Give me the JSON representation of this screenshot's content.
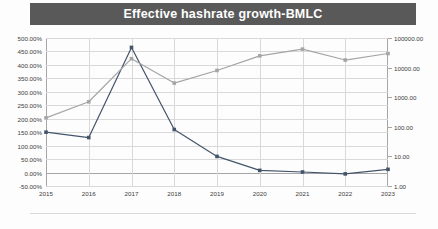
{
  "title": "Effective hashrate growth-BMLC",
  "colors": {
    "title_bar": "#595959",
    "title_text": "#ffffff",
    "series_growth": "#44546a",
    "series_hashrate": "#a5a5a5",
    "gridline": "#d9d9d9",
    "axis": "#a6a6a6",
    "tick_text": "#404040"
  },
  "chart_data": {
    "type": "line",
    "title": "Effective hashrate growth-BMLC",
    "xlabel": "",
    "ylabel": "",
    "grid": true,
    "legend": "none",
    "categories": [
      "2015",
      "2016",
      "2017",
      "2018",
      "2019",
      "2020",
      "2021",
      "2022",
      "2023"
    ],
    "axes": {
      "left": {
        "label": "",
        "scale": "linear",
        "ylim": [
          -50,
          500
        ],
        "tick_format": "percent",
        "ticks": [
          -50,
          0,
          50,
          100,
          150,
          200,
          250,
          300,
          350,
          400,
          450,
          500
        ],
        "tick_labels": [
          "-50.00%",
          "0.00%",
          "50.00%",
          "100.00%",
          "150.00%",
          "200.00%",
          "250.00%",
          "300.00%",
          "350.00%",
          "400.00%",
          "450.00%",
          "500.00%"
        ]
      },
      "right": {
        "label": "",
        "scale": "log",
        "ylim": [
          1,
          100000
        ],
        "ticks": [
          1,
          10,
          100,
          1000,
          10000,
          100000
        ],
        "tick_labels": [
          "1.00",
          "10.00",
          "100.00",
          "1000.00",
          "10000.00",
          "100000.00"
        ]
      }
    },
    "series": [
      {
        "name": "Effective hashrate growth",
        "axis": "left",
        "color": "#44546a",
        "unit": "percent",
        "values": [
          150,
          130,
          465,
          160,
          60,
          8,
          2,
          -5,
          12
        ]
      },
      {
        "name": "Effective hashrate",
        "axis": "right",
        "color": "#a5a5a5",
        "unit": "log",
        "values": [
          200,
          700,
          20000,
          3000,
          8000,
          25000,
          42000,
          18000,
          30000
        ]
      }
    ]
  }
}
